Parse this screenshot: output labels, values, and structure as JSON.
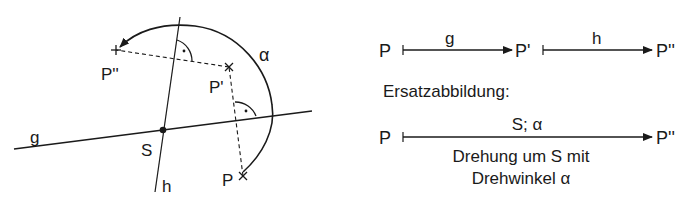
{
  "figure": {
    "left": {
      "lines": {
        "g": {
          "label": "g"
        },
        "h": {
          "label": "h"
        }
      },
      "points": {
        "S": "S",
        "P": "P",
        "P1": "P'",
        "P2": "P''"
      },
      "angle_label": "α",
      "right_angle_marks": 2
    },
    "right": {
      "chain": {
        "start": "P",
        "map1_label": "g",
        "mid": "P'",
        "map2_label": "h",
        "end": "P''"
      },
      "heading": "Ersatzabbildung:",
      "replacement": {
        "start": "P",
        "map_label": "S; α",
        "end": "P''",
        "desc_line1": "Drehung um S mit",
        "desc_line2": "Drehwinkel α"
      }
    }
  },
  "colors": {
    "stroke": "#1a1a1a",
    "background": "#ffffff"
  }
}
